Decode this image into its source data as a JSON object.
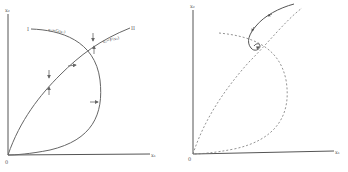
{
  "left_panel": {
    "y_axis_label": "x₂",
    "x_axis_label": "x₁",
    "origin_label": "0",
    "curve_I_label": "I",
    "curve_I_equation": "x₁=G(x₂)",
    "curve_II_label": "II",
    "curve_II_equation": "x₂=F(x₁)"
  },
  "right_panel": {
    "y_axis_label": "x₂",
    "x_axis_label": "x₁",
    "origin_label": "0"
  },
  "colors": {
    "ink": "#6a6a6a",
    "axis": "#555555",
    "background": "#ffffff"
  }
}
